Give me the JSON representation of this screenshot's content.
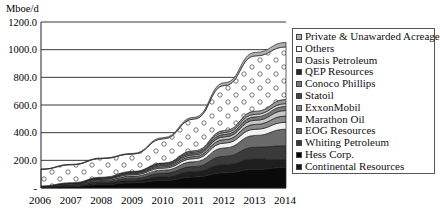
{
  "chart_data": {
    "type": "area",
    "stacked": true,
    "title": "",
    "ylabel": "Mboe/d",
    "xlabel": "",
    "x": [
      "2006",
      "2007",
      "2008",
      "2009",
      "2010",
      "2011",
      "2012",
      "2013",
      "2014"
    ],
    "ylim": [
      0,
      1200
    ],
    "yticks": [
      "-",
      "200.0",
      "400.0",
      "600.0",
      "800.0",
      "1000.0",
      "1200.0"
    ],
    "grid": true,
    "legend_position": "right",
    "series": [
      {
        "name": "Continental Resources",
        "color": "#0a0a0a",
        "values": [
          5,
          12,
          25,
          38,
          55,
          80,
          110,
          135,
          150
        ]
      },
      {
        "name": "Hess Corp.",
        "color": "#1e1e1e",
        "values": [
          3,
          6,
          12,
          18,
          28,
          40,
          60,
          75,
          55
        ]
      },
      {
        "name": "Whiting Petroleum",
        "color": "#3a3a3a",
        "values": [
          2,
          5,
          10,
          15,
          24,
          35,
          60,
          85,
          100
        ]
      },
      {
        "name": "EOG Resources",
        "color": "#6a6a6a",
        "values": [
          2,
          5,
          10,
          15,
          22,
          35,
          60,
          85,
          120
        ]
      },
      {
        "name": "Marathon Oil",
        "color": "#f2f2f2",
        "values": [
          1,
          3,
          6,
          10,
          15,
          22,
          35,
          45,
          50
        ]
      },
      {
        "name": "ExxonMobil",
        "color": "#8a8a8a",
        "values": [
          1,
          2,
          4,
          7,
          10,
          15,
          25,
          35,
          45
        ]
      },
      {
        "name": "Statoil",
        "color": "#c8c8c8",
        "values": [
          0,
          1,
          3,
          5,
          8,
          12,
          20,
          30,
          40
        ]
      },
      {
        "name": "Conoco Phillips",
        "color": "#7a7a7a",
        "values": [
          1,
          2,
          4,
          6,
          9,
          12,
          18,
          25,
          30
        ]
      },
      {
        "name": "QEP Resources",
        "color": "#d8d8d8",
        "values": [
          0,
          1,
          2,
          3,
          5,
          8,
          13,
          18,
          20
        ]
      },
      {
        "name": "Oasis Petroleum",
        "color": "#9a9a9a",
        "values": [
          0,
          1,
          2,
          3,
          5,
          10,
          15,
          22,
          30
        ]
      },
      {
        "name": "Others",
        "color": "#fafafa",
        "pattern": "circles",
        "values": [
          120,
          130,
          135,
          125,
          175,
          230,
          325,
          400,
          380
        ]
      },
      {
        "name": "Private & Unawarded Acreage",
        "color": "#b0b0b0",
        "values": [
          2,
          3,
          4,
          5,
          8,
          12,
          20,
          25,
          32
        ]
      }
    ]
  },
  "axis": {
    "unit_label": "Mboe/d",
    "y_ticks": [
      {
        "label": "1200.0",
        "value": 1200
      },
      {
        "label": "1000.0",
        "value": 1000
      },
      {
        "label": "800.0",
        "value": 800
      },
      {
        "label": "600.0",
        "value": 600
      },
      {
        "label": "400.0",
        "value": 400
      },
      {
        "label": "200.0",
        "value": 200
      },
      {
        "label": "-",
        "value": 0
      }
    ],
    "x_ticks": [
      "2006",
      "2007",
      "2008",
      "2009",
      "2010",
      "2011",
      "2012",
      "2013",
      "2014"
    ]
  },
  "legend": {
    "items": [
      {
        "label": "Private & Unawarded Acreage",
        "color": "#b0b0b0"
      },
      {
        "label": "Others",
        "color": "#ffffff"
      },
      {
        "label": "Oasis Petroleum",
        "color": "#9a9a9a"
      },
      {
        "label": "QEP Resources",
        "color": "#2a2a2a"
      },
      {
        "label": "Conoco Phillips",
        "color": "#7a7a7a"
      },
      {
        "label": "Statoil",
        "color": "#444444"
      },
      {
        "label": "ExxonMobil",
        "color": "#8a8a8a"
      },
      {
        "label": "Marathon Oil",
        "color": "#555555"
      },
      {
        "label": "EOG Resources",
        "color": "#6a6a6a"
      },
      {
        "label": "Whiting Petroleum",
        "color": "#3a3a3a"
      },
      {
        "label": "Hess Corp.",
        "color": "#000000"
      },
      {
        "label": "Continental Resources",
        "color": "#1a1a1a"
      }
    ]
  }
}
